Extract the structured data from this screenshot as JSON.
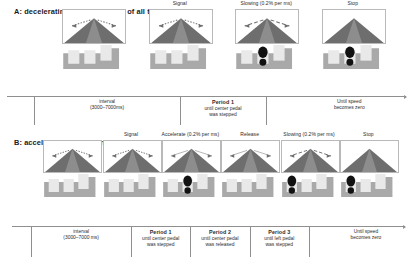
{
  "figure": {
    "background": "#ffffff",
    "colors": {
      "road_dark": "#6e6e6e",
      "road_light": "#c9c9c9",
      "pedal_block": "#a9a9a9",
      "pedal_face": "#e9e9e9",
      "foot": "#111111",
      "axis": "#8f8f8f",
      "text": "#222222"
    }
  },
  "panels": [
    {
      "id": "a",
      "title": "A: decelerating condition (90% of all trials)",
      "stages": [
        {
          "label": "",
          "foot": "none",
          "arrows": "dotted"
        },
        {
          "label": "Signal",
          "foot": "none",
          "arrows": "dotted"
        },
        {
          "label": "Slowing (0.2% per ms)",
          "foot": "center",
          "arrows": "dashed"
        },
        {
          "label": "Stop",
          "foot": "center",
          "arrows": "none"
        }
      ],
      "segments": [
        {
          "head": "",
          "lines": [
            "interval",
            "(3000–7000ms)"
          ]
        },
        {
          "head": "Period 1",
          "lines": [
            "until center pedal",
            "was stepped"
          ]
        },
        {
          "head": "",
          "lines": [
            "Until speed",
            "becomes zero"
          ]
        }
      ]
    },
    {
      "id": "b",
      "title": "B: accelerating condition (10% of all trials)",
      "stages": [
        {
          "label": "",
          "foot": "none",
          "arrows": "dotted"
        },
        {
          "label": "Signal",
          "foot": "none",
          "arrows": "dotted"
        },
        {
          "label": "Accelerate (0.2% per ms)",
          "foot": "center",
          "arrows": "thin"
        },
        {
          "label": "Release",
          "foot": "none",
          "arrows": "thin"
        },
        {
          "label": "Slowing (0.2% per ms)",
          "foot": "left",
          "arrows": "dashed"
        },
        {
          "label": "Stop",
          "foot": "left",
          "arrows": "none"
        }
      ],
      "segments": [
        {
          "head": "",
          "lines": [
            "interval",
            "(3000–7000 ms)"
          ]
        },
        {
          "head": "Period 1",
          "lines": [
            "until center pedal",
            "was stepped"
          ]
        },
        {
          "head": "Period 2",
          "lines": [
            "until center pedal",
            "was released"
          ]
        },
        {
          "head": "Period 3",
          "lines": [
            "until left pedal",
            "was stepped"
          ]
        },
        {
          "head": "",
          "lines": [
            "Until speed",
            "becomes zero"
          ]
        }
      ]
    }
  ]
}
